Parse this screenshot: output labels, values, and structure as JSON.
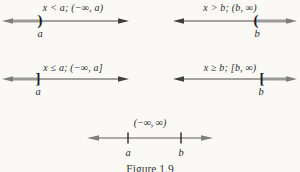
{
  "figure": {
    "caption": "Figure 1.9",
    "colors": {
      "background": "#faf9f6",
      "line": "#4a4a4a",
      "ray": "#9a9a9a",
      "text": "#2a2a2a"
    },
    "panels": [
      {
        "title": "x < a; (−∞, a)",
        "bracket": ")",
        "point_label": "a"
      },
      {
        "title": "x > b; (b, ∞)",
        "bracket": "(",
        "point_label": "b"
      },
      {
        "title": "x ≤ a; (−∞, a]",
        "bracket": "]",
        "point_label": "a"
      },
      {
        "title": "x ≥ b; [b, ∞)",
        "bracket": "[",
        "point_label": "b"
      }
    ],
    "bottom": {
      "title": "(−∞, ∞)",
      "left_tick_label": "a",
      "right_tick_label": "b"
    }
  }
}
